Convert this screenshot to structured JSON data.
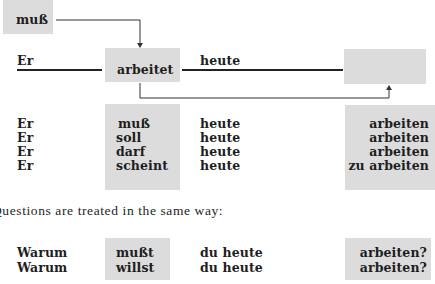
{
  "diagram": {
    "modal_box": {
      "label": "muß"
    },
    "main_sentence": {
      "subject": "Er",
      "verb": "arbeitet",
      "adverb": "heute",
      "empty_slot": ""
    },
    "conjugations": {
      "rows": [
        {
          "subject": "Er",
          "modal": "muß",
          "adverb": "heute",
          "infinitive": "arbeiten"
        },
        {
          "subject": "Er",
          "modal": "soll",
          "adverb": "heute",
          "infinitive": "arbeiten"
        },
        {
          "subject": "Er",
          "modal": "darf",
          "adverb": "heute",
          "infinitive": "arbeiten"
        },
        {
          "subject": "Er",
          "modal": "scheint",
          "adverb": "heute",
          "infinitive": "zu arbeiten"
        }
      ]
    }
  },
  "prose": {
    "text": "Questions are treated in the same way:"
  },
  "questions": {
    "rows": [
      {
        "interrogative": "Warum",
        "modal": "mußt",
        "rest": "du heute",
        "infinitive": "arbeiten?"
      },
      {
        "interrogative": "Warum",
        "modal": "willst",
        "rest": "du heute",
        "infinitive": "arbeiten?"
      }
    ]
  },
  "colors": {
    "box_fill": "#dcdcdc",
    "text": "#1e1e1e",
    "line": "#222222"
  }
}
